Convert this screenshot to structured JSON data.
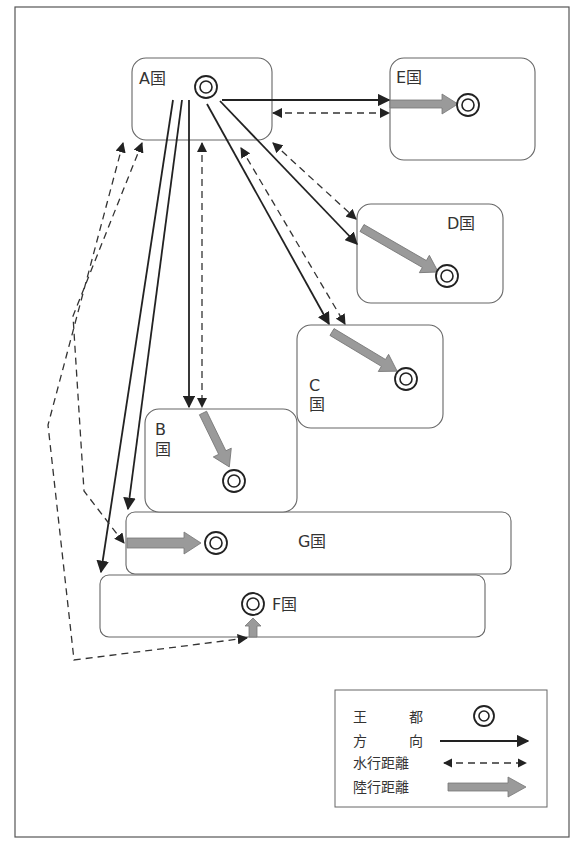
{
  "countries": {
    "A": {
      "label": "A国"
    },
    "B": {
      "label_letter": "B",
      "label_kuni": "国"
    },
    "C": {
      "label_letter": "C",
      "label_kuni": "国"
    },
    "D": {
      "label": "D国"
    },
    "E": {
      "label": "E国"
    },
    "F": {
      "label": "F国"
    },
    "G": {
      "label": "G国"
    }
  },
  "legend": {
    "items": [
      {
        "label": "王　都",
        "symbol": "double-circle-icon",
        "meaning": "capital"
      },
      {
        "label": "方　向",
        "symbol": "solid-arrow-icon",
        "meaning": "direction"
      },
      {
        "label": "水行距離",
        "symbol": "dashed-double-arrow-icon",
        "meaning": "water travel distance"
      },
      {
        "label": "陸行距離",
        "symbol": "gray-block-arrow-icon",
        "meaning": "land travel distance"
      }
    ],
    "label_capital_1": "王",
    "label_capital_2": "都",
    "label_direction_1": "方",
    "label_direction_2": "向",
    "label_water": "水行距離",
    "label_land": "陸行距離"
  },
  "colors": {
    "line": "#222222",
    "land_arrow": "#9a9a9a",
    "box_border": "#666666"
  }
}
